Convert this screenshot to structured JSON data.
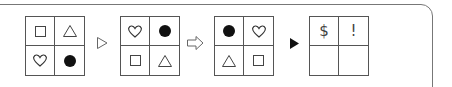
{
  "puzzle": {
    "grids": [
      {
        "cells": [
          "square",
          "triangle",
          "heart",
          "circle-filled"
        ]
      },
      {
        "cells": [
          "heart",
          "circle-filled",
          "square",
          "triangle"
        ]
      },
      {
        "cells": [
          "circle-filled",
          "heart",
          "triangle",
          "square"
        ]
      },
      {
        "cells": [
          "$",
          "!",
          "",
          ""
        ]
      }
    ],
    "arrows": [
      "outline-triangle-arrow",
      "hollow-block-arrow",
      "filled-triangle-arrow"
    ]
  }
}
